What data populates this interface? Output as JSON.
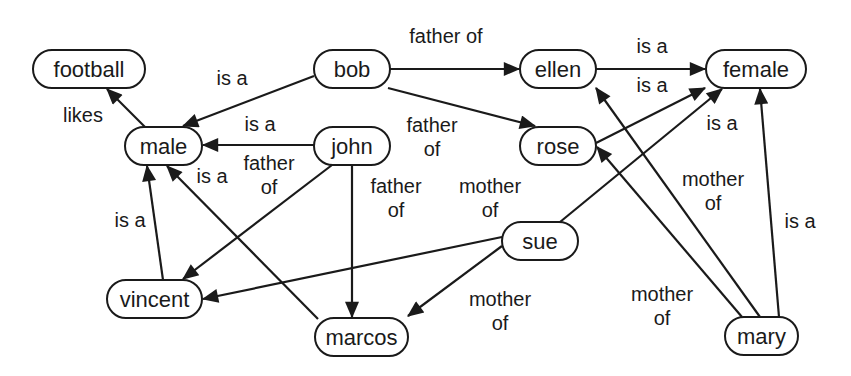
{
  "diagram": {
    "type": "semantic-network",
    "nodes": [
      {
        "id": "football",
        "label": "football",
        "x": 33,
        "y": 50,
        "w": 112,
        "h": 38
      },
      {
        "id": "male",
        "label": "male",
        "x": 125,
        "y": 127,
        "w": 77,
        "h": 38
      },
      {
        "id": "bob",
        "label": "bob",
        "x": 314,
        "y": 50,
        "w": 76,
        "h": 38
      },
      {
        "id": "john",
        "label": "john",
        "x": 314,
        "y": 127,
        "w": 76,
        "h": 38
      },
      {
        "id": "ellen",
        "label": "ellen",
        "x": 520,
        "y": 50,
        "w": 76,
        "h": 38
      },
      {
        "id": "rose",
        "label": "rose",
        "x": 520,
        "y": 127,
        "w": 76,
        "h": 38
      },
      {
        "id": "female",
        "label": "female",
        "x": 706,
        "y": 50,
        "w": 100,
        "h": 38
      },
      {
        "id": "vincent",
        "label": "vincent",
        "x": 107,
        "y": 280,
        "w": 95,
        "h": 38
      },
      {
        "id": "marcos",
        "label": "marcos",
        "x": 315,
        "y": 318,
        "w": 93,
        "h": 38
      },
      {
        "id": "sue",
        "label": "sue",
        "x": 502,
        "y": 222,
        "w": 76,
        "h": 38
      },
      {
        "id": "mary",
        "label": "mary",
        "x": 725,
        "y": 317,
        "w": 73,
        "h": 38
      }
    ],
    "edges": [
      {
        "from": "male",
        "to": "football",
        "label": "likes",
        "x1": 145,
        "y1": 127,
        "x2": 107,
        "y2": 89
      },
      {
        "from": "bob",
        "to": "male",
        "label": "is a",
        "x1": 314,
        "y1": 76,
        "x2": 183,
        "y2": 126
      },
      {
        "from": "bob",
        "to": "ellen",
        "label": "father of",
        "x1": 390,
        "y1": 69,
        "x2": 519,
        "y2": 69
      },
      {
        "from": "bob",
        "to": "rose",
        "label": "father of",
        "x1": 388,
        "y1": 88,
        "x2": 535,
        "y2": 126
      },
      {
        "from": "ellen",
        "to": "female",
        "label": "is a",
        "x1": 596,
        "y1": 69,
        "x2": 705,
        "y2": 69
      },
      {
        "from": "rose",
        "to": "female",
        "label": "is a",
        "x1": 596,
        "y1": 143,
        "x2": 705,
        "y2": 88
      },
      {
        "from": "sue",
        "to": "female",
        "label": "is a",
        "x1": 560,
        "y1": 222,
        "x2": 722,
        "y2": 89
      },
      {
        "from": "mary",
        "to": "female",
        "label": "is a",
        "x1": 779,
        "y1": 317,
        "x2": 760,
        "y2": 89
      },
      {
        "from": "john",
        "to": "male",
        "label": "is a",
        "x1": 314,
        "y1": 145,
        "x2": 203,
        "y2": 145
      },
      {
        "from": "john",
        "to": "vincent",
        "label": "father of",
        "x1": 332,
        "y1": 165,
        "x2": 183,
        "y2": 279
      },
      {
        "from": "john",
        "to": "marcos",
        "label": "father of",
        "x1": 352,
        "y1": 165,
        "x2": 352,
        "y2": 317
      },
      {
        "from": "vincent",
        "to": "male",
        "label": "is a",
        "x1": 163,
        "y1": 280,
        "x2": 147,
        "y2": 166
      },
      {
        "from": "marcos",
        "to": "male",
        "label": "is a",
        "x1": 318,
        "y1": 319,
        "x2": 167,
        "y2": 166
      },
      {
        "from": "sue",
        "to": "vincent",
        "label": "mother of",
        "x1": 502,
        "y1": 237,
        "x2": 203,
        "y2": 299
      },
      {
        "from": "sue",
        "to": "marcos",
        "label": "mother of",
        "x1": 502,
        "y1": 246,
        "x2": 408,
        "y2": 316
      },
      {
        "from": "mary",
        "to": "ellen",
        "label": "mother of",
        "x1": 760,
        "y1": 317,
        "x2": 596,
        "y2": 88
      },
      {
        "from": "mary",
        "to": "rose",
        "label": "mother of",
        "x1": 742,
        "y1": 317,
        "x2": 597,
        "y2": 147
      }
    ],
    "edge_labels": [
      {
        "text": "likes",
        "lines": [
          "likes"
        ],
        "x": 83,
        "y": 122
      },
      {
        "text": "is a",
        "lines": [
          "is a"
        ],
        "x": 232,
        "y": 85
      },
      {
        "text": "father of",
        "lines": [
          "father of"
        ],
        "x": 446,
        "y": 43
      },
      {
        "text": "is a",
        "lines": [
          "is a"
        ],
        "x": 652,
        "y": 53
      },
      {
        "text": "is a",
        "lines": [
          "is a"
        ],
        "x": 652,
        "y": 92
      },
      {
        "text": "is a",
        "lines": [
          "is a"
        ],
        "x": 260,
        "y": 131
      },
      {
        "text": "father of",
        "lines": [
          "father",
          "of"
        ],
        "x": 432,
        "y": 132
      },
      {
        "text": "is a",
        "lines": [
          "is a"
        ],
        "x": 722,
        "y": 130
      },
      {
        "text": "father of",
        "lines": [
          "father",
          "of"
        ],
        "x": 269,
        "y": 170
      },
      {
        "text": "is a",
        "lines": [
          "is a"
        ],
        "x": 212,
        "y": 183
      },
      {
        "text": "father of",
        "lines": [
          "father",
          "of"
        ],
        "x": 396,
        "y": 193
      },
      {
        "text": "mother of",
        "lines": [
          "mother",
          "of"
        ],
        "x": 490,
        "y": 193
      },
      {
        "text": "mother of",
        "lines": [
          "mother",
          "of"
        ],
        "x": 713,
        "y": 186
      },
      {
        "text": "is a",
        "lines": [
          "is a"
        ],
        "x": 130,
        "y": 227
      },
      {
        "text": "is a",
        "lines": [
          "is a"
        ],
        "x": 800,
        "y": 228
      },
      {
        "text": "mother of",
        "lines": [
          "mother",
          "of"
        ],
        "x": 500,
        "y": 306
      },
      {
        "text": "mother of",
        "lines": [
          "mother",
          "of"
        ],
        "x": 662,
        "y": 301
      }
    ],
    "colors": {
      "stroke": "#1a1a1a",
      "background": "#ffffff",
      "node_fill": "#ffffff"
    }
  }
}
